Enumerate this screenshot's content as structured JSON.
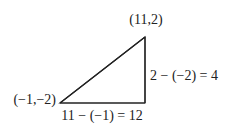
{
  "diagram": {
    "type": "right-triangle",
    "vertices": {
      "top_right": {
        "label": "(11,2)",
        "x": 11,
        "y": 2
      },
      "bottom_left": {
        "label": "(−1,−2)",
        "x": -1,
        "y": -2
      },
      "bottom_right": {
        "x": 11,
        "y": -2
      }
    },
    "side_labels": {
      "vertical": "2 − (−2) = 4",
      "horizontal": "11 − (−1) = 12"
    },
    "colors": {
      "stroke": "#222222",
      "text": "#222222",
      "background": "#ffffff"
    }
  }
}
